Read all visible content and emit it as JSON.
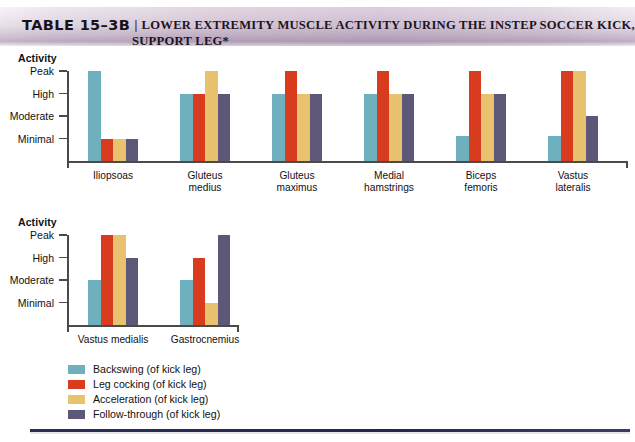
{
  "header": {
    "table_number": "TABLE 15–3B",
    "separator": "|",
    "title_line1": "LOWER EXTREMITY MUSCLE ACTIVITY DURING THE INSTEP SOCCER KICK,",
    "title_line2": "SUPPORT LEG*"
  },
  "axis_title": "Activity",
  "legend": [
    {
      "label": "Backswing (of kick leg)",
      "color": "#6fb0be"
    },
    {
      "label": "Leg cocking (of kick leg)",
      "color": "#d93b1f"
    },
    {
      "label": "Acceleration (of kick leg)",
      "color": "#e9c270"
    },
    {
      "label": "Follow-through (of kick leg)",
      "color": "#5e5878"
    }
  ],
  "chart_data": [
    {
      "type": "bar",
      "title": "Activity",
      "xlabel": "",
      "ylabel": "Activity",
      "ytick_labels": [
        "Peak",
        "High",
        "Moderate",
        "Minimal"
      ],
      "ylevels": {
        "Peak": 4,
        "High": 3,
        "Moderate": 2,
        "Minimal": 1
      },
      "ylim": [
        0,
        4
      ],
      "grid": false,
      "legend_position": "bottom-left",
      "categories": [
        "Iliopsoas",
        "Gluteus medius",
        "Gluteus maximus",
        "Medial hamstrings",
        "Biceps femoris",
        "Vastus lateralis"
      ],
      "categories_wrapped": [
        [
          "Iliopsoas"
        ],
        [
          "Gluteus",
          "medius"
        ],
        [
          "Gluteus",
          "maximus"
        ],
        [
          "Medial",
          "hamstrings"
        ],
        [
          "Biceps",
          "femoris"
        ],
        [
          "Vastus",
          "lateralis"
        ]
      ],
      "series": [
        {
          "name": "Backswing (of kick leg)",
          "color": "#6fb0be",
          "values": [
            4,
            3,
            3,
            3,
            1.1,
            1.1
          ],
          "levels": [
            "Peak",
            "High",
            "High",
            "High",
            "Minimal",
            "Minimal"
          ]
        },
        {
          "name": "Leg cocking (of kick leg)",
          "color": "#d93b1f",
          "values": [
            1,
            3,
            4,
            4,
            4,
            4
          ],
          "levels": [
            "Minimal",
            "High",
            "Peak",
            "Peak",
            "Peak",
            "Peak"
          ]
        },
        {
          "name": "Acceleration (of kick leg)",
          "color": "#e9c270",
          "values": [
            1,
            4,
            3,
            3,
            3,
            4
          ],
          "levels": [
            "Minimal",
            "Peak",
            "High",
            "High",
            "High",
            "Peak"
          ]
        },
        {
          "name": "Follow-through (of kick leg)",
          "color": "#5e5878",
          "values": [
            1,
            3,
            3,
            3,
            3,
            2
          ],
          "levels": [
            "Minimal",
            "High",
            "High",
            "High",
            "High",
            "Moderate"
          ]
        }
      ]
    },
    {
      "type": "bar",
      "title": "Activity",
      "xlabel": "",
      "ylabel": "Activity",
      "ytick_labels": [
        "Peak",
        "High",
        "Moderate",
        "Minimal"
      ],
      "ylevels": {
        "Peak": 4,
        "High": 3,
        "Moderate": 2,
        "Minimal": 1
      },
      "ylim": [
        0,
        4
      ],
      "grid": false,
      "legend_position": "bottom-left",
      "categories": [
        "Vastus medialis",
        "Gastrocnemius"
      ],
      "categories_wrapped": [
        [
          "Vastus medialis"
        ],
        [
          "Gastrocnemius"
        ]
      ],
      "series": [
        {
          "name": "Backswing (of kick leg)",
          "color": "#6fb0be",
          "values": [
            2,
            2
          ],
          "levels": [
            "Moderate",
            "Moderate"
          ]
        },
        {
          "name": "Leg cocking (of kick leg)",
          "color": "#d93b1f",
          "values": [
            4,
            3
          ],
          "levels": [
            "Peak",
            "High"
          ]
        },
        {
          "name": "Acceleration (of kick leg)",
          "color": "#e9c270",
          "values": [
            4,
            1
          ],
          "levels": [
            "Peak",
            "Minimal"
          ]
        },
        {
          "name": "Follow-through (of kick leg)",
          "color": "#5e5878",
          "values": [
            3,
            4
          ],
          "levels": [
            "High",
            "Peak"
          ]
        }
      ]
    }
  ]
}
